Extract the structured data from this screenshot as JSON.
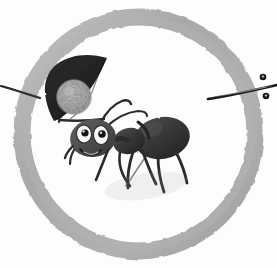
{
  "canvas": {
    "width": 277,
    "height": 269,
    "background_color": "#fdfdfd",
    "title": "Cartoon ant carrying a crescent banner inside a gray brush ring"
  },
  "palette": {
    "background": "#fdfdfd",
    "ring_gray": "#a9a9a9",
    "ring_gray_light": "#bdbdbd",
    "ring_gray_dark": "#9a9a9a",
    "ink_black": "#1b1b1b",
    "ink_soft_black": "#2e2e2e",
    "body_gray": "#4a4a4a",
    "moon_gray": "#b2b2b2",
    "moon_gray_shadow": "#9d9d9d",
    "eye_white": "#f6f6f6",
    "pupil_black": "#141414"
  },
  "scene": {
    "ring": {
      "label": "brush-painted gray circle",
      "center_x": 139,
      "center_y": 134,
      "radius_x": 117,
      "radius_y": 117,
      "stroke_width": 17,
      "color": "#a9a9a9"
    },
    "left_twig": {
      "label": "thin ink line entering from left edge",
      "x1": 2,
      "y1": 88,
      "x2": 38,
      "y2": 97,
      "color": "#222222"
    },
    "right_twig": {
      "label": "thin ink line exiting to right edge",
      "x1": 210,
      "y1": 98,
      "x2": 277,
      "y2": 88,
      "color": "#1b1b1b"
    },
    "right_dots": [
      {
        "label": "small ink dot above twig",
        "cx": 263,
        "cy": 77,
        "r": 3.3
      },
      {
        "label": "small ink dot below twig",
        "cx": 266,
        "cy": 96,
        "r": 3.3
      }
    ],
    "banner": {
      "label": "dark crescent flag with moon disc",
      "fill": "#242424",
      "moon": {
        "cx": 74,
        "cy": 97,
        "r": 17,
        "fill": "#b2b2b2"
      },
      "pole": {
        "x1": 62,
        "y1": 122,
        "x2": 104,
        "y2": 120
      }
    },
    "ant": {
      "label": "cartoon ant with smiling face",
      "head": {
        "cx": 93,
        "cy": 137,
        "rx": 23,
        "ry": 19,
        "fill": "#4f4f4f"
      },
      "eyes": [
        {
          "label": "left-eye",
          "cx": 84,
          "cy": 134,
          "rx": 7.5,
          "ry": 9,
          "pupil_cx": 85,
          "pupil_cy": 133,
          "pupil_r": 3.6
        },
        {
          "label": "right-eye",
          "cx": 101,
          "cy": 135,
          "rx": 7.5,
          "ry": 9.5,
          "pupil_cx": 102,
          "pupil_cy": 134,
          "pupil_r": 3.8
        }
      ],
      "mouth": {
        "label": "smiling mouth",
        "color": "#1e1e1e"
      },
      "thorax": {
        "cx": 129,
        "cy": 140,
        "rx": 16,
        "ry": 13,
        "fill": "#3b3b3b"
      },
      "abdomen": {
        "cx": 161,
        "cy": 138,
        "rx": 27,
        "ry": 21,
        "fill": "#333333"
      },
      "antennae_count": 2,
      "legs_count": 6
    }
  },
  "meta": {
    "caption": "",
    "signature": ""
  }
}
